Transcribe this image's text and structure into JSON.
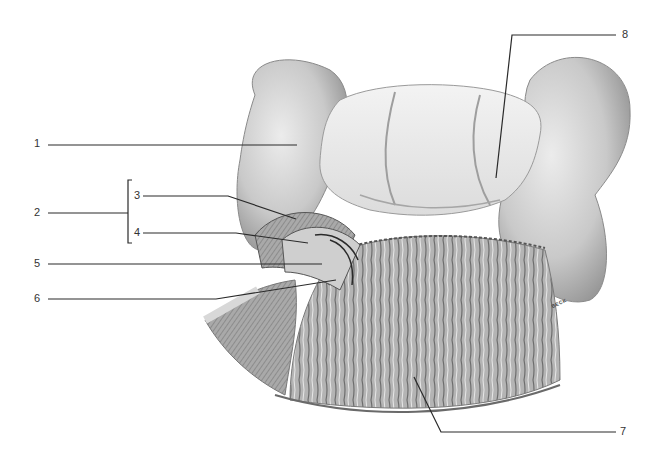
{
  "figure": {
    "signature": "BECK"
  },
  "labels": [
    {
      "id": "1",
      "text": "1",
      "x": 38,
      "y": 143
    },
    {
      "id": "2",
      "text": "2",
      "x": 38,
      "y": 212
    },
    {
      "id": "3",
      "text": "3",
      "x": 133,
      "y": 194
    },
    {
      "id": "4",
      "text": "4",
      "x": 133,
      "y": 232
    },
    {
      "id": "5",
      "text": "5",
      "x": 38,
      "y": 263
    },
    {
      "id": "6",
      "text": "6",
      "x": 38,
      "y": 298
    },
    {
      "id": "7",
      "text": "7",
      "x": 621,
      "y": 430
    },
    {
      "id": "8",
      "text": "8",
      "x": 622,
      "y": 32
    }
  ],
  "colors": {
    "background": "#ffffff",
    "leader_line": "#2a2a2a",
    "tissue_light": "#e6e6e6",
    "tissue_mid": "#bdbdbd",
    "tissue_dark": "#7a7a7a"
  }
}
